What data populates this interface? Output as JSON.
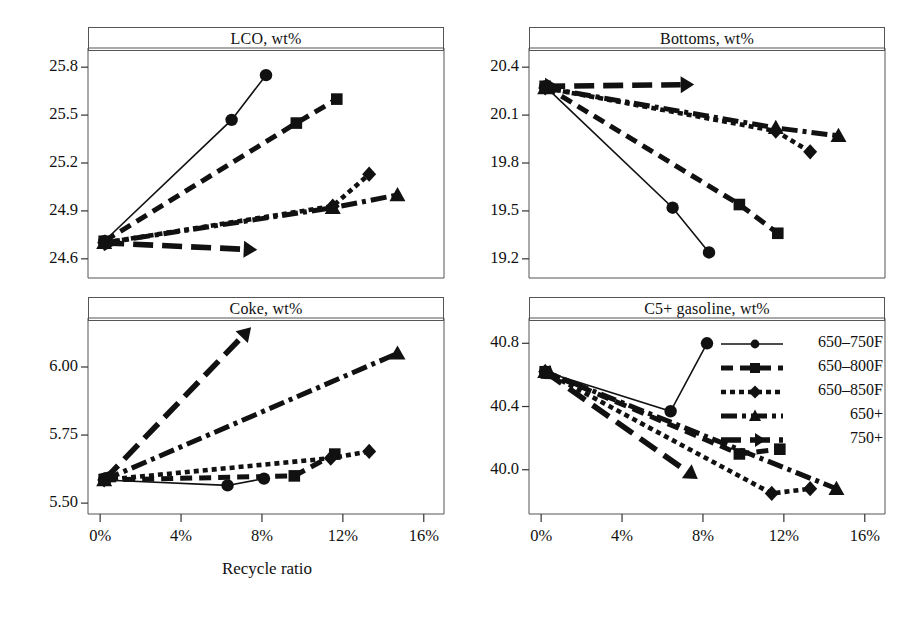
{
  "figure": {
    "xlabel": "Recycle ratio",
    "background": "#ffffff",
    "ink": "#111111"
  },
  "legend": {
    "position": "inside-bottom-right-panel",
    "entries": [
      {
        "label": "650–750F",
        "marker": "circle",
        "dash": "solid"
      },
      {
        "label": "650–800F",
        "marker": "square",
        "dash": "dashed"
      },
      {
        "label": "650–850F",
        "marker": "diamond",
        "dash": "dotted"
      },
      {
        "label": "650+",
        "marker": "triangle",
        "dash": "dashdot"
      },
      {
        "label": "750+",
        "marker": "arrow",
        "dash": "longdash"
      }
    ]
  },
  "chart_data": [
    {
      "type": "line",
      "title": "LCO, wt%",
      "xlabel": "Recycle ratio",
      "ylabel": "",
      "xlim": [
        -0.6,
        17.0
      ],
      "ylim": [
        24.48,
        25.92
      ],
      "xticks": [
        0,
        4,
        8,
        12,
        16
      ],
      "xticklabels": [
        "0%",
        "4%",
        "8%",
        "12%",
        "16%"
      ],
      "yticks": [
        24.6,
        24.9,
        25.2,
        25.5,
        25.8
      ],
      "yticklabels": [
        "24.6",
        "24.9",
        "25.2",
        "25.5",
        "25.8"
      ],
      "grid": false,
      "series": [
        {
          "name": "650–750F",
          "marker": "circle",
          "dash": "solid",
          "x": [
            0.2,
            6.5,
            8.2
          ],
          "y": [
            24.71,
            25.47,
            25.75
          ]
        },
        {
          "name": "650–800F",
          "marker": "square",
          "dash": "dashed",
          "x": [
            0.2,
            9.7,
            11.7
          ],
          "y": [
            24.71,
            25.45,
            25.6
          ]
        },
        {
          "name": "650–850F",
          "marker": "diamond",
          "dash": "dotted",
          "x": [
            0.2,
            11.5,
            13.3
          ],
          "y": [
            24.7,
            24.93,
            25.13
          ]
        },
        {
          "name": "650+",
          "marker": "triangle",
          "dash": "dashdot",
          "x": [
            0.2,
            11.5,
            14.7
          ],
          "y": [
            24.7,
            24.92,
            25.0
          ]
        },
        {
          "name": "750+",
          "marker": "arrow",
          "dash": "longdash",
          "x": [
            0.2,
            7.1
          ],
          "y": [
            24.7,
            24.66
          ]
        }
      ]
    },
    {
      "type": "line",
      "title": "Bottoms, wt%",
      "xlabel": "Recycle ratio",
      "ylabel": "",
      "xlim": [
        -0.6,
        17.0
      ],
      "ylim": [
        19.08,
        20.52
      ],
      "xticks": [
        0,
        4,
        8,
        12,
        16
      ],
      "xticklabels": [
        "0%",
        "4%",
        "8%",
        "12%",
        "16%"
      ],
      "yticks": [
        19.2,
        19.5,
        19.8,
        20.1,
        20.4
      ],
      "yticklabels": [
        "19.2",
        "19.5",
        "19.8",
        "20.1",
        "20.4"
      ],
      "grid": false,
      "series": [
        {
          "name": "650–750F",
          "marker": "circle",
          "dash": "solid",
          "x": [
            0.2,
            6.5,
            8.3
          ],
          "y": [
            20.28,
            19.52,
            19.24
          ]
        },
        {
          "name": "650–800F",
          "marker": "square",
          "dash": "dashed",
          "x": [
            0.2,
            9.8,
            11.7
          ],
          "y": [
            20.28,
            19.54,
            19.36
          ]
        },
        {
          "name": "650–850F",
          "marker": "diamond",
          "dash": "dotted",
          "x": [
            0.2,
            11.6,
            13.3
          ],
          "y": [
            20.27,
            20.0,
            19.87
          ]
        },
        {
          "name": "650+",
          "marker": "triangle",
          "dash": "dashdot",
          "x": [
            0.2,
            11.6,
            14.7
          ],
          "y": [
            20.27,
            20.02,
            19.97
          ]
        },
        {
          "name": "750+",
          "marker": "arrow",
          "dash": "longdash",
          "x": [
            0.2,
            6.9
          ],
          "y": [
            20.28,
            20.29
          ]
        }
      ]
    },
    {
      "type": "line",
      "title": "Coke, wt%",
      "xlabel": "Recycle ratio",
      "ylabel": "",
      "xlim": [
        -0.6,
        17.0
      ],
      "ylim": [
        5.46,
        6.18
      ],
      "xticks": [
        0,
        4,
        8,
        12,
        16
      ],
      "xticklabels": [
        "0%",
        "4%",
        "8%",
        "12%",
        "16%"
      ],
      "yticks": [
        5.5,
        5.75,
        6.0
      ],
      "yticklabels": [
        "5.50",
        "5.75",
        "6.00"
      ],
      "grid": false,
      "series": [
        {
          "name": "650–750F",
          "marker": "circle",
          "dash": "solid",
          "x": [
            0.2,
            6.3,
            8.1
          ],
          "y": [
            5.585,
            5.565,
            5.59
          ]
        },
        {
          "name": "650–800F",
          "marker": "square",
          "dash": "dashed",
          "x": [
            0.2,
            9.6,
            11.6
          ],
          "y": [
            5.585,
            5.6,
            5.68
          ]
        },
        {
          "name": "650–850F",
          "marker": "diamond",
          "dash": "dotted",
          "x": [
            0.2,
            11.4,
            13.3
          ],
          "y": [
            5.585,
            5.665,
            5.69
          ]
        },
        {
          "name": "650+",
          "marker": "triangle",
          "dash": "dashdot",
          "x": [
            0.2,
            14.7
          ],
          "y": [
            5.585,
            6.05
          ]
        },
        {
          "name": "750+",
          "marker": "arrow",
          "dash": "longdash",
          "x": [
            0.2,
            7.0
          ],
          "y": [
            5.585,
            6.11
          ]
        }
      ]
    },
    {
      "type": "line",
      "title": "C5+ gasoline, wt%",
      "xlabel": "Recycle ratio",
      "ylabel": "",
      "xlim": [
        -0.6,
        17.0
      ],
      "ylim": [
        39.72,
        40.96
      ],
      "xticks": [
        0,
        4,
        8,
        12,
        16
      ],
      "xticklabels": [
        "0%",
        "4%",
        "8%",
        "12%",
        "16%"
      ],
      "yticks": [
        40.0,
        40.4,
        40.8
      ],
      "yticklabels": [
        "40.0",
        "40.4",
        "40.8"
      ],
      "grid": false,
      "series": [
        {
          "name": "650–750F",
          "marker": "circle",
          "dash": "solid",
          "x": [
            0.2,
            6.4,
            8.2
          ],
          "y": [
            40.62,
            40.37,
            40.8
          ]
        },
        {
          "name": "650–800F",
          "marker": "square",
          "dash": "dashed",
          "x": [
            0.2,
            9.8,
            11.8
          ],
          "y": [
            40.62,
            40.1,
            40.13
          ]
        },
        {
          "name": "650–850F",
          "marker": "diamond",
          "dash": "dotted",
          "x": [
            0.2,
            11.4,
            13.3
          ],
          "y": [
            40.62,
            39.85,
            39.88
          ]
        },
        {
          "name": "650+",
          "marker": "triangle",
          "dash": "dashdot",
          "x": [
            0.2,
            14.6
          ],
          "y": [
            40.62,
            39.88
          ]
        },
        {
          "name": "750+",
          "marker": "arrow",
          "dash": "longdash",
          "x": [
            0.2,
            7.2
          ],
          "y": [
            40.62,
            39.99
          ]
        }
      ]
    }
  ]
}
